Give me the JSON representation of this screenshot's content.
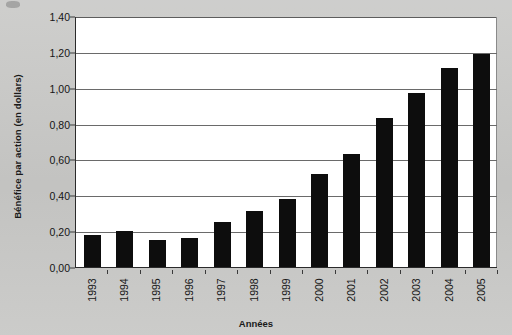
{
  "chart_data": {
    "type": "bar",
    "title": "",
    "xlabel": "Années",
    "ylabel": "Bénéfice par action (en dollars)",
    "categories": [
      "1993",
      "1994",
      "1995",
      "1996",
      "1997",
      "1998",
      "1999",
      "2000",
      "2001",
      "2002",
      "2003",
      "2004",
      "2005"
    ],
    "values": [
      0.18,
      0.2,
      0.15,
      0.16,
      0.25,
      0.31,
      0.38,
      0.52,
      0.63,
      0.83,
      0.97,
      1.11,
      1.19
    ],
    "ylim": [
      0.0,
      1.4
    ],
    "ytick_labels": [
      "0,00",
      "0,20",
      "0,40",
      "0,60",
      "0,80",
      "1,00",
      "1,20",
      "1,40"
    ],
    "ytick_values": [
      0.0,
      0.2,
      0.4,
      0.6,
      0.8,
      1.0,
      1.2,
      1.4
    ],
    "grid": true,
    "legend": "none",
    "series_color": "#0d0d0d",
    "plot_background": "#ffffff",
    "figure_background": "#c9c9c7"
  }
}
